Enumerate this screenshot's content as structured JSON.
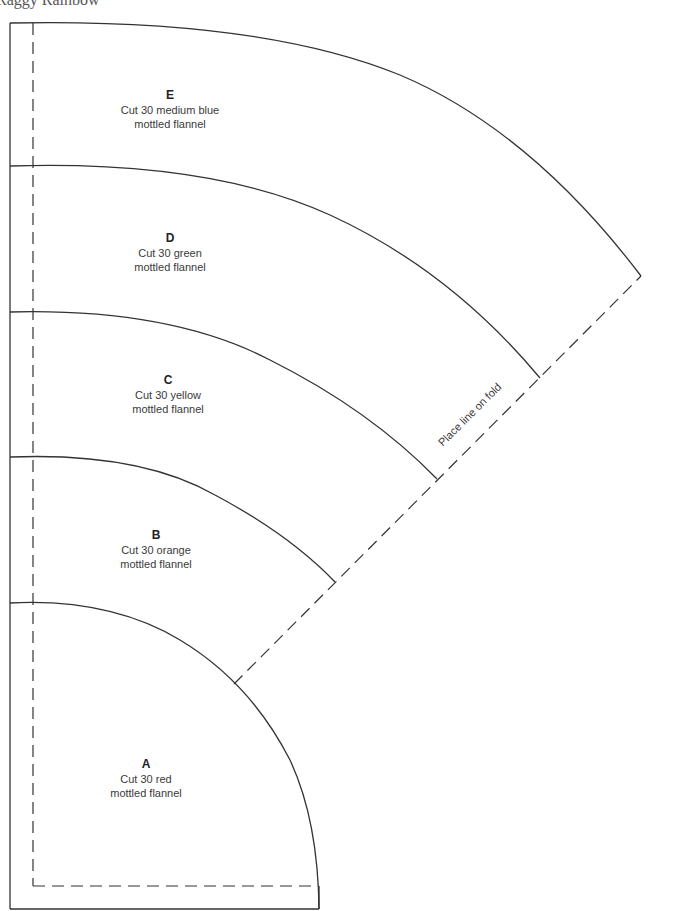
{
  "page": {
    "title": "Raggy Rainbow"
  },
  "pattern": {
    "line_color": "#333333",
    "fold_label": "Place line on fold",
    "pieces": [
      {
        "letter": "E",
        "line1": "Cut 30 medium blue",
        "line2": "mottled flannel"
      },
      {
        "letter": "D",
        "line1": "Cut 30 green",
        "line2": "mottled flannel"
      },
      {
        "letter": "C",
        "line1": "Cut 30 yellow",
        "line2": "mottled flannel"
      },
      {
        "letter": "B",
        "line1": "Cut 30 orange",
        "line2": "mottled flannel"
      },
      {
        "letter": "A",
        "line1": "Cut 30 red",
        "line2": "mottled flannel"
      }
    ]
  }
}
